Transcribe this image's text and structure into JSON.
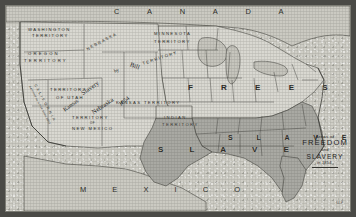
{
  "map": {
    "title_legend": {
      "line1": "Areas of",
      "line2": "FREEDOM",
      "line3": "and",
      "line4": "SLAVERY",
      "line5": "in 1854."
    },
    "plate_number": "64-P",
    "regions": {
      "canada": "C A N A D A",
      "mexico": "M E X I C O",
      "free_states": "F R E E   S T A T E S",
      "slave_states": "S L A V E   S T A T E S",
      "slave_band": "S L A V E"
    },
    "banner": {
      "word1": "Slavery",
      "word2": "by",
      "word3": "Kansas",
      "word4": "Nebraska",
      "word5": "Bill",
      "word6": "1854"
    },
    "territories": [
      {
        "name": "WASHINGTON TERRITORY",
        "line1": "WASHINGTON",
        "line2": "TERRITORY"
      },
      {
        "name": "OREGON TERRITORY",
        "line1": "OREGON",
        "line2": "TERRITORY"
      },
      {
        "name": "TERRITORY OF UTAH",
        "line1": "TERRITORY",
        "line2": "OF UTAH"
      },
      {
        "name": "TERRITORY OF NEW MEXICO",
        "line1": "TERRITORY",
        "line2": "OF",
        "line3": "NEW MEXICO"
      },
      {
        "name": "NEBRASKA TERRITORY",
        "line1": "NEBRASKA",
        "line2": "TERRITORY"
      },
      {
        "name": "MINNESOTA TERRITORY",
        "line1": "MINNESOTA",
        "line2": "TERRITORY"
      },
      {
        "name": "KANSAS TERRITORY",
        "line1": "KANSAS TERRITORY"
      },
      {
        "name": "INDIAN TERRITORY",
        "line1": "INDIAN",
        "line2": "TERRITORY"
      }
    ],
    "california": {
      "name": "C A L I F O R N I A",
      "note": "Admitted as a free State 1850"
    },
    "colors": {
      "free_fill": "#d9d8d1",
      "slave_fill": "#a9a9a3",
      "outside_fill": "#cbcac2",
      "paper": "#cfcec6",
      "ink": "#2b2b27",
      "frame": "#4a4a46"
    }
  }
}
